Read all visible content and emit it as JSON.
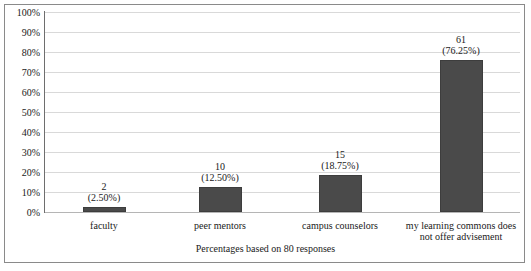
{
  "chart_data": {
    "type": "bar",
    "title": "",
    "subtitle": "",
    "xlabel": "Percentages based on 80 responses",
    "ylabel": "",
    "categories": [
      "faculty",
      "peer mentors",
      "campus counselors",
      "my learning commons does not offer advisement"
    ],
    "category_lines": [
      [
        "faculty"
      ],
      [
        "peer mentors"
      ],
      [
        "campus counselors"
      ],
      [
        "my learning commons does",
        "not offer advisement"
      ]
    ],
    "values": [
      2,
      10,
      15,
      61
    ],
    "percents": [
      2.5,
      12.5,
      18.75,
      76.25
    ],
    "value_labels": [
      "2",
      "10",
      "15",
      "61"
    ],
    "percent_labels": [
      "(2.50%)",
      "(12.50%)",
      "(18.75%)",
      "(76.25%)"
    ],
    "total_responses": 80,
    "ylim": [
      0,
      100
    ],
    "ytick_values": [
      0,
      10,
      20,
      30,
      40,
      50,
      60,
      70,
      80,
      90,
      100
    ],
    "ytick_labels": [
      "0%",
      "10%",
      "20%",
      "30%",
      "40%",
      "50%",
      "60%",
      "70%",
      "80%",
      "90%",
      "100%"
    ],
    "grid": true,
    "legend": "none",
    "bar_color": "#4a4a4a",
    "gridline_color": "#d9d9d9",
    "axis_color": "#6e6e6e",
    "border_color": "#8a8a8a",
    "text_color": "#1a1a1a",
    "background_color": "#ffffff"
  }
}
